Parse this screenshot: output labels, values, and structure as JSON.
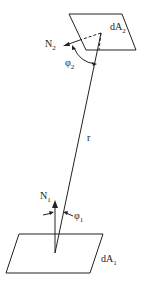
{
  "diagram": {
    "title": "",
    "surfaces": [
      {
        "id": "dA2",
        "label": "dA",
        "subscript": "2",
        "position": "top"
      },
      {
        "id": "dA1",
        "label": "dA",
        "subscript": "1",
        "position": "bottom"
      }
    ],
    "normals": [
      {
        "id": "N2",
        "label": "N",
        "subscript": "2"
      },
      {
        "id": "N1",
        "label": "N",
        "subscript": "1"
      }
    ],
    "angles": [
      {
        "id": "phi2",
        "label": "φ",
        "subscript": "2"
      },
      {
        "id": "phi1",
        "label": "φ",
        "subscript": "1"
      }
    ],
    "distance": {
      "label": "r"
    },
    "colors": {
      "line": "#222222",
      "background": "#ffffff"
    }
  }
}
